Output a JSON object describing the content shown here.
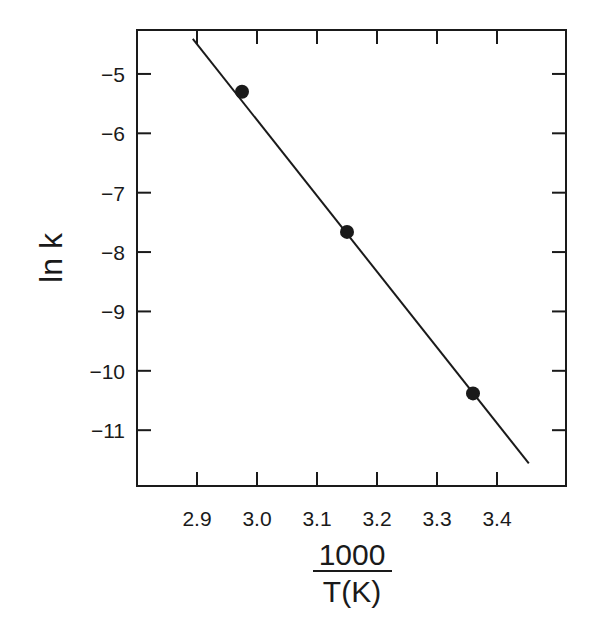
{
  "chart_data": {
    "type": "scatter",
    "title": "",
    "xlabel": "1000/T(K)",
    "xlabel_numerator": "1000",
    "xlabel_denominator": "T(K)",
    "ylabel": "ln k",
    "xlim": [
      2.8,
      3.515
    ],
    "ylim": [
      -11.94,
      -4.26
    ],
    "xticks": [
      2.9,
      3.0,
      3.1,
      3.2,
      3.3,
      3.4
    ],
    "xtick_labels": [
      "2.9",
      "3.0",
      "3.1",
      "3.2",
      "3.3",
      "3.4"
    ],
    "yticks": [
      -5,
      -6,
      -7,
      -8,
      -9,
      -10,
      -11
    ],
    "ytick_labels": [
      "−5",
      "−6",
      "−7",
      "−8",
      "−9",
      "−10",
      "−11"
    ],
    "grid": false,
    "legend": null,
    "series": [
      {
        "name": "data",
        "marker": "filled-circle",
        "x": [
          2.975,
          3.15,
          3.36
        ],
        "y": [
          -5.3,
          -7.66,
          -10.38
        ]
      },
      {
        "name": "linear fit",
        "style": "line",
        "x": [
          2.893,
          3.453
        ],
        "y": [
          -4.41,
          -11.56
        ]
      }
    ],
    "colors": {
      "ink": "#1a1a1a",
      "background": "#ffffff"
    }
  },
  "layout": {
    "plot_left": 137,
    "plot_right": 566,
    "plot_top": 30,
    "plot_bottom": 486
  }
}
